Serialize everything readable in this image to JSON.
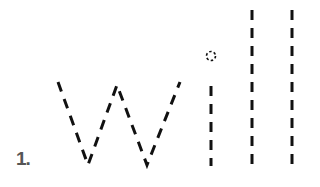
{
  "worksheet": {
    "item_number": "1.",
    "trace_word": "will",
    "letters": [
      "w",
      "i",
      "l",
      "l"
    ],
    "stroke_color": "#111111",
    "number_color": "#555555",
    "style": "dashed-tracing"
  }
}
